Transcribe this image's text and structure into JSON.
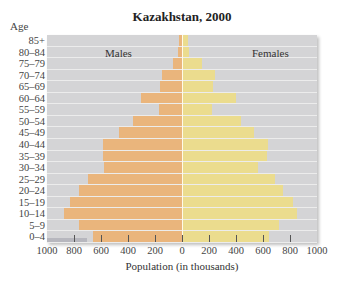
{
  "chart_data": {
    "type": "bar",
    "subtype": "population-pyramid",
    "title": "Kazakhstan, 2000",
    "xlabel": "Population (in thousands)",
    "ylabel": "Age",
    "xlim": [
      -1000,
      1000
    ],
    "x_tick_labels": [
      "1000",
      "800",
      "600",
      "400",
      "200",
      "0",
      "200",
      "400",
      "600",
      "800",
      "1000"
    ],
    "x_tick_values": [
      -1000,
      -800,
      -600,
      -400,
      -200,
      0,
      200,
      400,
      600,
      800,
      1000
    ],
    "categories": [
      "85+",
      "80–84",
      "75–79",
      "70–74",
      "65–69",
      "60–64",
      "55–59",
      "50–54",
      "45–49",
      "40–44",
      "35–39",
      "30–34",
      "25–29",
      "20–24",
      "15–19",
      "10–14",
      "5–9",
      "0–4"
    ],
    "series": [
      {
        "name": "Males",
        "color": "#eab57c",
        "side": "left",
        "values": [
          25,
          30,
          65,
          150,
          160,
          305,
          170,
          365,
          470,
          585,
          585,
          580,
          695,
          765,
          830,
          875,
          765,
          660
        ]
      },
      {
        "name": "Females",
        "color": "#ebdc8e",
        "side": "right",
        "values": [
          45,
          50,
          150,
          245,
          230,
          400,
          220,
          435,
          535,
          640,
          630,
          565,
          690,
          745,
          820,
          850,
          720,
          645
        ]
      }
    ],
    "legend": {
      "position": "inside-top",
      "entries": [
        "Males",
        "Females"
      ]
    },
    "grid": false,
    "background_color": "#d4d4d6"
  },
  "labels": {
    "title": "Kazakhstan, 2000",
    "age_header": "Age",
    "males": "Males",
    "females": "Females",
    "xlabel": "Population (in thousands)"
  }
}
